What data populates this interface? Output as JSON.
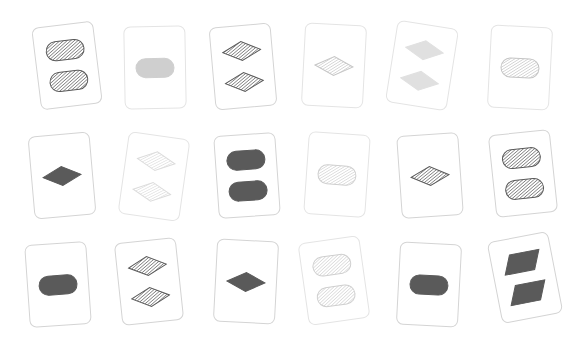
{
  "scene": {
    "type": "set-card-game-board",
    "background_color": "#ffffff",
    "grid": {
      "columns": 6,
      "rows": 3,
      "total_cards": 18
    },
    "card_size": {
      "width": 62,
      "height": 83
    },
    "palette": {
      "dark_gray": "#5a5a5a",
      "mid_gray": "#9a9a9a",
      "light_gray": "#cfcfcf",
      "very_light_gray": "#e6e6e6",
      "card_face": "#ffffff",
      "card_border": "#cfcfcf"
    },
    "cards": [
      {
        "id": "card-1",
        "row": 1,
        "col": 1,
        "x": 36,
        "y": 24,
        "rotate": -7,
        "count": 2,
        "shape": "pill",
        "shading": "striped",
        "color": "#5a5a5a",
        "border_tone": "mid-border"
      },
      {
        "id": "card-2",
        "row": 1,
        "col": 2,
        "x": 124,
        "y": 26,
        "rotate": -1,
        "count": 1,
        "shape": "pill",
        "shading": "solid",
        "color": "#cfcfcf",
        "border_tone": "light-border"
      },
      {
        "id": "card-3",
        "row": 1,
        "col": 3,
        "x": 212,
        "y": 25,
        "rotate": -5,
        "count": 2,
        "shape": "diamond",
        "shading": "striped",
        "color": "#5a5a5a",
        "border_tone": "mid-border"
      },
      {
        "id": "card-4",
        "row": 1,
        "col": 4,
        "x": 303,
        "y": 24,
        "rotate": 3,
        "count": 1,
        "shape": "diamond",
        "shading": "striped",
        "color": "#c6c6c6",
        "border_tone": "light-border"
      },
      {
        "id": "card-5",
        "row": 1,
        "col": 5,
        "x": 391,
        "y": 24,
        "rotate": 9,
        "count": 2,
        "shape": "diamond",
        "shading": "solid",
        "color": "#e0e0e0",
        "border_tone": "light-border"
      },
      {
        "id": "card-6",
        "row": 1,
        "col": 6,
        "x": 489,
        "y": 26,
        "rotate": 3,
        "count": 1,
        "shape": "pill",
        "shading": "striped",
        "color": "#c4c4c4",
        "border_tone": "light-border"
      },
      {
        "id": "card-7",
        "row": 2,
        "col": 1,
        "x": 31,
        "y": 134,
        "rotate": -5,
        "count": 1,
        "shape": "diamond",
        "shading": "solid",
        "color": "#5a5a5a",
        "border_tone": "mid-border"
      },
      {
        "id": "card-8",
        "row": 2,
        "col": 2,
        "x": 123,
        "y": 135,
        "rotate": 8,
        "count": 2,
        "shape": "diamond",
        "shading": "striped",
        "color": "#dcdcdc",
        "border_tone": "light-border"
      },
      {
        "id": "card-9",
        "row": 2,
        "col": 3,
        "x": 216,
        "y": 134,
        "rotate": -4,
        "count": 2,
        "shape": "pill",
        "shading": "solid",
        "color": "#5a5a5a",
        "border_tone": "mid-border"
      },
      {
        "id": "card-10",
        "row": 2,
        "col": 4,
        "x": 306,
        "y": 133,
        "rotate": 4,
        "count": 1,
        "shape": "pill",
        "shading": "striped",
        "color": "#cfcfcf",
        "border_tone": "light-border"
      },
      {
        "id": "card-11",
        "row": 2,
        "col": 5,
        "x": 399,
        "y": 134,
        "rotate": -4,
        "count": 1,
        "shape": "diamond",
        "shading": "striped",
        "color": "#5a5a5a",
        "border_tone": "mid-border"
      },
      {
        "id": "card-12",
        "row": 2,
        "col": 6,
        "x": 492,
        "y": 132,
        "rotate": -6,
        "count": 2,
        "shape": "pill",
        "shading": "striped",
        "color": "#5a5a5a",
        "border_tone": "mid-border"
      },
      {
        "id": "card-13",
        "row": 3,
        "col": 1,
        "x": 27,
        "y": 243,
        "rotate": -4,
        "count": 1,
        "shape": "pill",
        "shading": "solid",
        "color": "#5a5a5a",
        "border_tone": "mid-border"
      },
      {
        "id": "card-14",
        "row": 3,
        "col": 2,
        "x": 118,
        "y": 240,
        "rotate": -6,
        "count": 2,
        "shape": "diamond",
        "shading": "striped",
        "color": "#5a5a5a",
        "border_tone": "mid-border"
      },
      {
        "id": "card-15",
        "row": 3,
        "col": 3,
        "x": 215,
        "y": 240,
        "rotate": 3,
        "count": 1,
        "shape": "diamond",
        "shading": "solid",
        "color": "#5a5a5a",
        "border_tone": "mid-border"
      },
      {
        "id": "card-16",
        "row": 3,
        "col": 4,
        "x": 303,
        "y": 239,
        "rotate": -8,
        "count": 2,
        "shape": "pill",
        "shading": "striped",
        "color": "#cfcfcf",
        "border_tone": "light-border"
      },
      {
        "id": "card-17",
        "row": 3,
        "col": 5,
        "x": 398,
        "y": 243,
        "rotate": 3,
        "count": 1,
        "shape": "pill",
        "shading": "solid",
        "color": "#5a5a5a",
        "border_tone": "mid-border"
      },
      {
        "id": "card-18",
        "row": 3,
        "col": 6,
        "x": 494,
        "y": 236,
        "rotate": -11,
        "count": 2,
        "shape": "parallelogram",
        "shading": "solid",
        "color": "#5a5a5a",
        "border_tone": "mid-border"
      }
    ]
  }
}
